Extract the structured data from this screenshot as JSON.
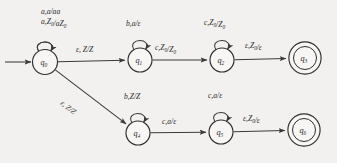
{
  "diagram": {
    "type": "pushdown-automaton-state-diagram",
    "title": "",
    "states": [
      {
        "id": "q0",
        "label": "q",
        "sub": "0",
        "cx": 45,
        "cy": 62,
        "r": 12.5,
        "accepting": false,
        "start": true
      },
      {
        "id": "q1",
        "label": "q",
        "sub": "1",
        "cx": 140,
        "cy": 60,
        "r": 12.0,
        "accepting": false,
        "start": false
      },
      {
        "id": "q2",
        "label": "q",
        "sub": "2",
        "cx": 222,
        "cy": 60,
        "r": 12.0,
        "accepting": false,
        "start": false
      },
      {
        "id": "q3",
        "label": "q",
        "sub": "3",
        "cx": 305,
        "cy": 58,
        "r": 12.5,
        "accepting": true,
        "start": false
      },
      {
        "id": "q4",
        "label": "q",
        "sub": "4",
        "cx": 138,
        "cy": 133,
        "r": 12.0,
        "accepting": false,
        "start": false
      },
      {
        "id": "q5",
        "label": "q",
        "sub": "5",
        "cx": 221,
        "cy": 132,
        "r": 12.0,
        "accepting": false,
        "start": false
      },
      {
        "id": "q6",
        "label": "q",
        "sub": "6",
        "cx": 304,
        "cy": 130,
        "r": 12.5,
        "accepting": true,
        "start": false
      }
    ],
    "self_loops": [
      {
        "id": "loop-q0-line1",
        "state": "q0",
        "text": "a,a/aa",
        "parts": [
          {
            "t": "a,a/aa"
          }
        ],
        "x": 41,
        "y": 14
      },
      {
        "id": "loop-q0-line2",
        "state": "q0",
        "text": "a,Z0/aZ0",
        "parts": [
          {
            "t": "a,Z"
          },
          {
            "t": "0",
            "sub": true
          },
          {
            "t": "/aZ"
          },
          {
            "t": "0",
            "sub": true
          }
        ],
        "x": 41,
        "y": 24
      },
      {
        "id": "loop-q1",
        "state": "q1",
        "text": "b,a/ε",
        "parts": [
          {
            "t": "b,a/ε"
          }
        ],
        "x": 126,
        "y": 26
      },
      {
        "id": "loop-q2",
        "state": "q2",
        "text": "c,Z0/Z0",
        "parts": [
          {
            "t": "c,Z"
          },
          {
            "t": "0",
            "sub": true
          },
          {
            "t": "/Z"
          },
          {
            "t": "0",
            "sub": true
          }
        ],
        "x": 204,
        "y": 25
      },
      {
        "id": "loop-q4",
        "state": "q4",
        "text": "b,Z/Z",
        "parts": [
          {
            "t": "b,Z/Z"
          }
        ],
        "x": 124,
        "y": 99
      },
      {
        "id": "loop-q5",
        "state": "q5",
        "text": "c,a/ε",
        "parts": [
          {
            "t": "c,a/ε"
          }
        ],
        "x": 208,
        "y": 98
      }
    ],
    "transitions": [
      {
        "id": "t-q0-q1",
        "from": "q0",
        "to": "q1",
        "text": "ε,  Z/Z",
        "parts": [
          {
            "t": "ε,  Z/Z"
          }
        ],
        "x": 76,
        "y": 52,
        "rotate": 0
      },
      {
        "id": "t-q1-q2",
        "from": "q1",
        "to": "q2",
        "text": "c,Z0/Z0",
        "parts": [
          {
            "t": "c,Z"
          },
          {
            "t": "0",
            "sub": true
          },
          {
            "t": "/Z"
          },
          {
            "t": "0",
            "sub": true
          }
        ],
        "x": 155,
        "y": 50,
        "rotate": 0
      },
      {
        "id": "t-q2-q3",
        "from": "q2",
        "to": "q3",
        "text": "ε,Z0/ε",
        "parts": [
          {
            "t": "ε,Z"
          },
          {
            "t": "0",
            "sub": true
          },
          {
            "t": "/ε"
          }
        ],
        "x": 245,
        "y": 48,
        "rotate": 0
      },
      {
        "id": "t-q0-q4",
        "from": "q0",
        "to": "q4",
        "text": "ε, Z/Z",
        "parts": [
          {
            "t": "ε, Z/Z"
          }
        ],
        "x": 60,
        "y": 104,
        "rotate": 38
      },
      {
        "id": "t-q4-q5",
        "from": "q4",
        "to": "q5",
        "text": "c,a/ε",
        "parts": [
          {
            "t": "c,a/ε"
          }
        ],
        "x": 162,
        "y": 124,
        "rotate": 0
      },
      {
        "id": "t-q5-q6",
        "from": "q5",
        "to": "q6",
        "text": "ε,Z0/ε",
        "parts": [
          {
            "t": "ε,Z"
          },
          {
            "t": "0",
            "sub": true
          },
          {
            "t": "/ε"
          }
        ],
        "x": 243,
        "y": 121,
        "rotate": 0
      }
    ],
    "start_arrow": {
      "id": "start-arrow",
      "x1": 5,
      "y1": 62,
      "x2": 31,
      "y2": 62
    },
    "colors": {
      "background": "#f2f1ef",
      "stroke": "#2e2e2e",
      "text": "#2b2b2b"
    }
  }
}
